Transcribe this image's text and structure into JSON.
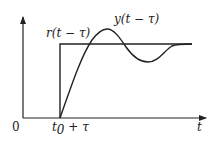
{
  "diagram": {
    "type": "step-response",
    "axes": {
      "origin_label": "0",
      "x_label": "t",
      "x_tick_label_main": "t",
      "x_tick_label_sub": "0",
      "x_tick_label_rest": " + τ"
    },
    "curves": [
      {
        "name": "reference-step",
        "label_main": "r",
        "label_rest": "(t − τ)"
      },
      {
        "name": "response",
        "label_main": "y",
        "label_rest": "(t − τ)"
      }
    ],
    "colors": {
      "line": "#222222",
      "background": "#ffffff"
    }
  }
}
